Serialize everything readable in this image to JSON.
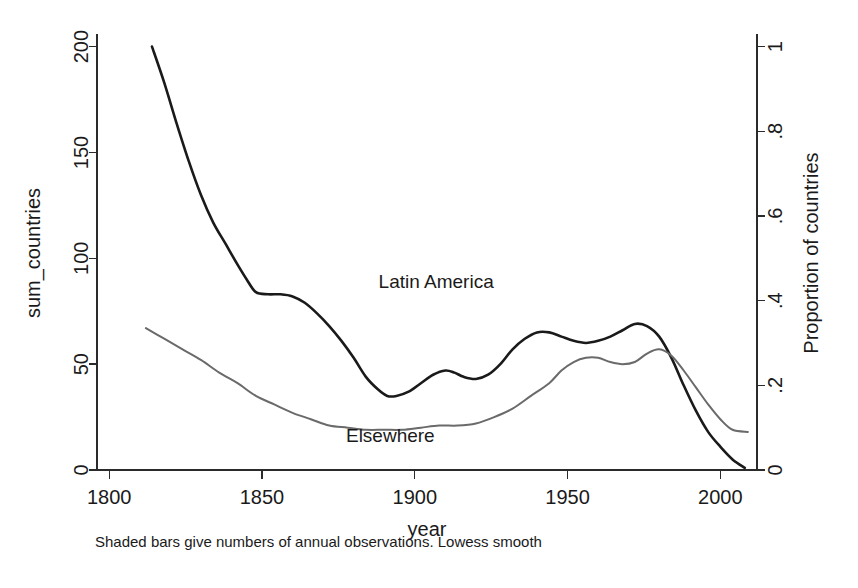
{
  "chart_data": {
    "type": "line",
    "title": "",
    "subtitle": "",
    "note": "Shaded bars give numbers of annual observations. Lowess smooth",
    "xlabel": "year",
    "ylabel": "sum_countries",
    "y2label": "Proportion of countries",
    "xlim": [
      1796,
      2012
    ],
    "ylim": [
      0,
      205
    ],
    "y2lim": [
      0,
      1.025
    ],
    "grid": false,
    "legend": "inline-annotations",
    "xticks": [
      1800,
      1850,
      1900,
      1950,
      2000
    ],
    "xtick_labels": [
      "1800",
      "1850",
      "1900",
      "1950",
      "2000"
    ],
    "yticks": [
      0,
      50,
      100,
      150,
      200
    ],
    "ytick_labels": [
      "0",
      "50",
      "100",
      "150",
      "200"
    ],
    "y2ticks": [
      0,
      0.2,
      0.4,
      0.6,
      0.8,
      1
    ],
    "y2tick_labels": [
      "0",
      ".2",
      ".4",
      ".6",
      ".8",
      "1"
    ],
    "series": [
      {
        "name": "Latin America",
        "color": "#1a1a1a",
        "width": 2.6,
        "label_x": 1907,
        "label_y": 86,
        "x": [
          1814,
          1818,
          1822,
          1826,
          1830,
          1834,
          1838,
          1842,
          1845,
          1848,
          1852,
          1856,
          1860,
          1864,
          1868,
          1872,
          1876,
          1880,
          1884,
          1888,
          1891,
          1894,
          1898,
          1902,
          1906,
          1910,
          1913,
          1916,
          1920,
          1924,
          1928,
          1932,
          1936,
          1940,
          1944,
          1948,
          1952,
          1956,
          1960,
          1964,
          1968,
          1972,
          1976,
          1980,
          1984,
          1988,
          1992,
          1996,
          2000,
          2004,
          2008
        ],
        "y": [
          200,
          183,
          164,
          146,
          130,
          117,
          107,
          97,
          90,
          84,
          83,
          83,
          82,
          79,
          74,
          68,
          61,
          53,
          44,
          38,
          35,
          35,
          37,
          41,
          45,
          47,
          46,
          44,
          43,
          45,
          50,
          57,
          62,
          65,
          65,
          63,
          61,
          60,
          61,
          63,
          66,
          69,
          68,
          63,
          53,
          40,
          28,
          18,
          11,
          5,
          1
        ]
      },
      {
        "name": "Elsewhere",
        "color": "#6a6a6a",
        "width": 2.0,
        "label_x": 1892,
        "label_y": 13,
        "x": [
          1812,
          1818,
          1824,
          1830,
          1836,
          1842,
          1848,
          1854,
          1860,
          1866,
          1872,
          1878,
          1884,
          1890,
          1896,
          1902,
          1908,
          1914,
          1920,
          1926,
          1932,
          1938,
          1944,
          1948,
          1952,
          1956,
          1960,
          1964,
          1968,
          1972,
          1976,
          1980,
          1984,
          1988,
          1992,
          1996,
          2000,
          2004,
          2009
        ],
        "y": [
          67,
          62,
          57,
          52,
          46,
          41,
          35,
          31,
          27,
          24,
          21,
          20,
          19,
          19,
          19,
          20,
          21,
          21,
          22,
          25,
          29,
          35,
          41,
          47,
          51,
          53,
          53,
          51,
          50,
          51,
          55,
          57,
          54,
          47,
          39,
          31,
          24,
          19,
          18
        ]
      }
    ]
  },
  "axes": {
    "x_title": "year",
    "y_title": "sum_countries",
    "y2_title": "Proportion of countries"
  },
  "annotations": {
    "latin_america": "Latin America",
    "elsewhere": "Elsewhere",
    "footnote": "Shaded bars give numbers of annual observations. Lowess smooth"
  }
}
